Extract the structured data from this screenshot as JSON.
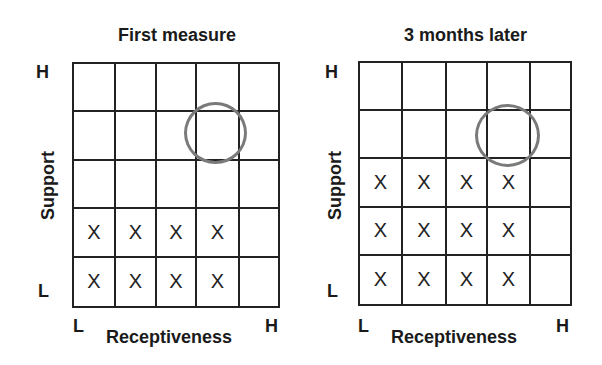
{
  "panels": [
    {
      "title": "First measure",
      "y_axis": {
        "label": "Support",
        "high": "H",
        "low": "L"
      },
      "x_axis": {
        "label": "Receptiveness",
        "low": "L",
        "high": "H"
      },
      "grid": {
        "rows": 5,
        "cols": 5,
        "cells": [
          [
            "",
            "",
            "",
            "",
            ""
          ],
          [
            "",
            "",
            "",
            "",
            ""
          ],
          [
            "",
            "",
            "",
            "",
            ""
          ],
          [
            "X",
            "X",
            "X",
            "X",
            ""
          ],
          [
            "X",
            "X",
            "X",
            "X",
            ""
          ]
        ]
      },
      "target_circle": {
        "row": 2,
        "col": 4,
        "color": "#7a7a7a"
      }
    },
    {
      "title": "3 months later",
      "y_axis": {
        "label": "Support",
        "high": "H",
        "low": "L"
      },
      "x_axis": {
        "label": "Receptiveness",
        "low": "L",
        "high": "H"
      },
      "grid": {
        "rows": 5,
        "cols": 5,
        "cells": [
          [
            "",
            "",
            "",
            "",
            ""
          ],
          [
            "",
            "",
            "",
            "",
            ""
          ],
          [
            "X",
            "X",
            "X",
            "X",
            ""
          ],
          [
            "X",
            "X",
            "X",
            "X",
            ""
          ],
          [
            "X",
            "X",
            "X",
            "X",
            ""
          ]
        ]
      },
      "target_circle": {
        "row": 2,
        "col": 4,
        "color": "#7a7a7a"
      }
    }
  ]
}
